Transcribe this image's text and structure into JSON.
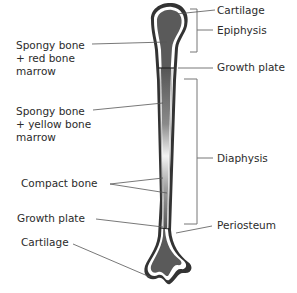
{
  "diagram": {
    "colors": {
      "bone_fill": "#5a5a5a",
      "bone_outline": "#333333",
      "periosteum_gap": "#ffffff",
      "shaft_light": "#f2f2f2",
      "leader_line": "#555555",
      "text": "#2b2b2b"
    },
    "labels": {
      "spongy_red": "Spongy bone\n+ red bone\nmarrow",
      "spongy_yellow": "Spongy bone\n+ yellow bone\nmarrow",
      "compact_bone": "Compact bone",
      "growth_plate_left": "Growth plate",
      "cartilage_left": "Cartilage",
      "cartilage_right": "Cartilage",
      "epiphysis": "Epiphysis",
      "growth_plate_right": "Growth plate",
      "diaphysis": "Diaphysis",
      "periosteum": "Periosteum"
    }
  }
}
